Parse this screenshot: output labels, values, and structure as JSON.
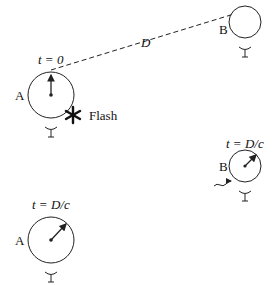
{
  "diagram": {
    "labels": {
      "t0": "t = 0",
      "distance": "D",
      "flash": "Flash",
      "observer_a_top": "A",
      "observer_b_top": "B",
      "t_dc_b": "t = D/c",
      "observer_b_bottom": "B",
      "t_dc_a": "t = D/c",
      "observer_a_bottom": "A"
    },
    "icons": {
      "flash": "asterisk-flash-icon",
      "eye": "eye-icon"
    },
    "colors": {
      "stroke": "#222222",
      "background": "#ffffff"
    }
  }
}
